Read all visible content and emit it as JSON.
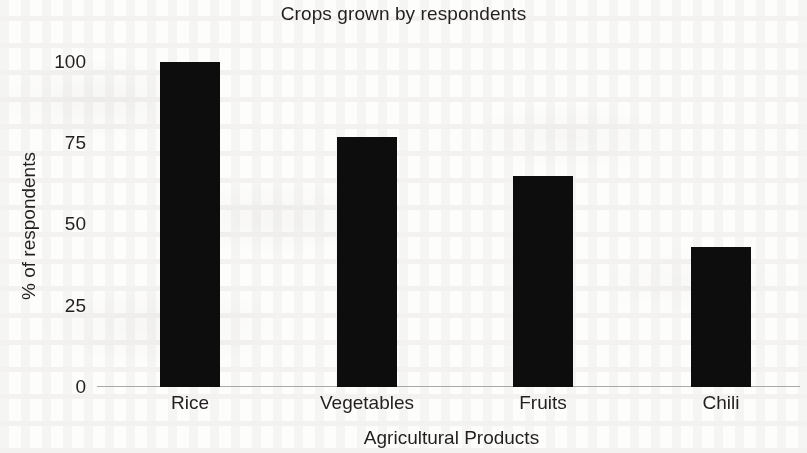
{
  "chart_data": {
    "type": "bar",
    "title": "Crops grown by respondents",
    "xlabel": "Agricultural Products",
    "ylabel": "% of respondents",
    "categories": [
      "Rice",
      "Vegetables",
      "Fruits",
      "Chili"
    ],
    "values": [
      100,
      77,
      65,
      43
    ],
    "ylim": [
      0,
      100
    ],
    "yticks": [
      0,
      25,
      50,
      75,
      100
    ],
    "ytick_labels": [
      "0",
      "25",
      "50",
      "75",
      "100"
    ],
    "grid": false,
    "legend": false,
    "bar_color": "#0d0d0d",
    "axis_color": "#a9a9a9",
    "text_color": "#231f20",
    "background_color": "#fdfdfc"
  }
}
